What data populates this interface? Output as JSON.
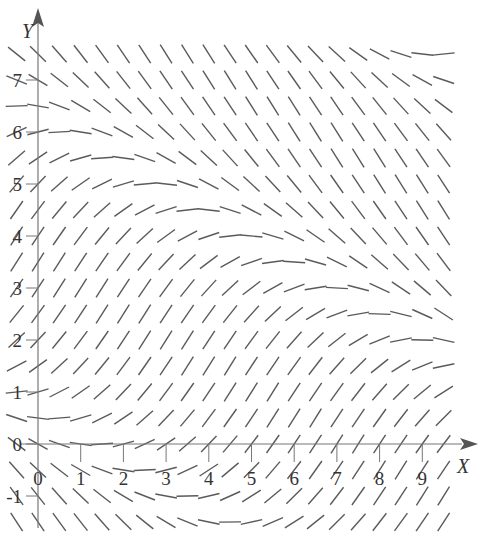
{
  "chart_data": {
    "type": "slope_field",
    "title": "",
    "xlabel": "X",
    "ylabel": "Y",
    "xlim": [
      -0.5,
      9.8
    ],
    "ylim": [
      -1.8,
      8.0
    ],
    "x_ticks": [
      0,
      1,
      2,
      3,
      4,
      5,
      6,
      7,
      8,
      9
    ],
    "y_ticks": [
      -1,
      0,
      1,
      2,
      3,
      4,
      5,
      6,
      7
    ],
    "x_tick_labels": [
      "0",
      "1",
      "2",
      "3",
      "4",
      "5",
      "6",
      "7",
      "8",
      "9"
    ],
    "y_tick_labels": [
      "-1",
      "0",
      "1",
      "2",
      "3",
      "4",
      "5",
      "6",
      "7"
    ],
    "grid": false,
    "grid_spacing": {
      "dx": 0.5,
      "dy": 0.5
    },
    "sample_x_range": [
      -0.5,
      9.5
    ],
    "sample_y_range": [
      -1.5,
      7.5
    ],
    "slope_model": {
      "description": "slope = -A*sin(k*(y + m*x - c)); zero-slope curves lie along lines y = c - m*x",
      "A": 1.3,
      "k": 0.556,
      "m": 0.48,
      "c": 6.3
    },
    "zero_slope_curves": [
      {
        "points": [
          [
            0,
            6.3
          ],
          [
            2,
            5.3
          ],
          [
            4,
            4.4
          ],
          [
            6,
            3.4
          ],
          [
            9,
            2.0
          ]
        ]
      },
      {
        "points": [
          [
            0,
            -0.3
          ],
          [
            2,
            -1.2
          ],
          [
            3,
            -1.7
          ]
        ]
      },
      {
        "points": [
          [
            7,
            7.7
          ],
          [
            9,
            6.7
          ]
        ]
      }
    ],
    "segment_color": "#5a5a5a",
    "axis_color": "#777777"
  }
}
